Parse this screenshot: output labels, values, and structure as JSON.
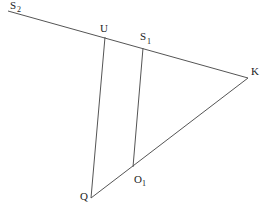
{
  "diagram": {
    "points": {
      "S2": {
        "label": "S",
        "sub": "2",
        "x": 8,
        "y": 11
      },
      "U": {
        "label": "U",
        "sub": "",
        "x": 105,
        "y": 37
      },
      "S1": {
        "label": "S",
        "sub": "1",
        "x": 143,
        "y": 48
      },
      "K": {
        "label": "K",
        "sub": "",
        "x": 248,
        "y": 78
      },
      "Q": {
        "label": "Q",
        "sub": "",
        "x": 91,
        "y": 198
      },
      "O1": {
        "label": "O",
        "sub": "1",
        "x": 133,
        "y": 167
      }
    },
    "segments": [
      [
        "S2",
        "K"
      ],
      [
        "K",
        "Q"
      ],
      [
        "U",
        "Q"
      ],
      [
        "S1",
        "O1"
      ]
    ]
  }
}
